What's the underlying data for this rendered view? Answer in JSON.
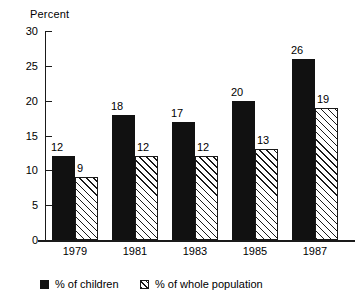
{
  "chart_data": {
    "type": "bar",
    "title": "",
    "xlabel": "",
    "ylabel": "Percent",
    "ylim": [
      0,
      30
    ],
    "yticks": [
      0,
      5,
      10,
      15,
      20,
      25,
      30
    ],
    "grid": false,
    "legend_position": "bottom",
    "categories": [
      "1979",
      "1981",
      "1983",
      "1985",
      "1987"
    ],
    "series": [
      {
        "name": "% of children",
        "key": "children",
        "color": "#111111",
        "fill": "solid",
        "values": [
          12,
          18,
          17,
          20,
          26
        ]
      },
      {
        "name": "% of whole population",
        "key": "whole",
        "color": "#1a1a1a",
        "fill": "diagonal-hatch",
        "values": [
          9,
          12,
          12,
          13,
          19
        ]
      }
    ]
  },
  "axis": {
    "y_title": "Percent",
    "y_tick_labels": [
      "0",
      "5",
      "10",
      "15",
      "20",
      "25",
      "30"
    ],
    "x_tick_labels": [
      "1979",
      "1981",
      "1983",
      "1985",
      "1987"
    ]
  },
  "bar_labels": {
    "children": [
      "12",
      "18",
      "17",
      "20",
      "26"
    ],
    "whole": [
      "9",
      "12",
      "12",
      "13",
      "19"
    ]
  },
  "legend": {
    "children_label": "% of children",
    "whole_label": "% of whole population"
  }
}
